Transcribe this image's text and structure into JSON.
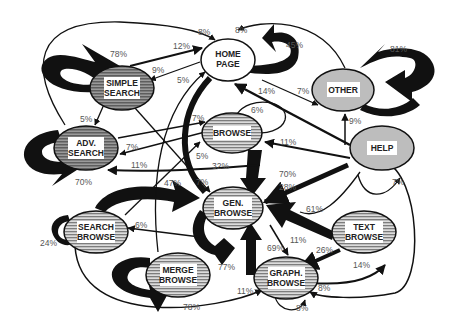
{
  "diagram": {
    "type": "state-transition-graph",
    "nodes": [
      {
        "id": "simple_search",
        "label_lines": [
          "SIMPLE",
          "SEARCH"
        ],
        "style": "dark-striped",
        "self_loop": "78%"
      },
      {
        "id": "home_page",
        "label_lines": [
          "HOME",
          "PAGE"
        ],
        "style": "white",
        "self_loop": "45%"
      },
      {
        "id": "other",
        "label_lines": [
          "OTHER"
        ],
        "style": "light-gray",
        "self_loop": "81%"
      },
      {
        "id": "adv_search",
        "label_lines": [
          "ADV.",
          "SEARCH"
        ],
        "style": "dark-striped",
        "self_loop": "70%"
      },
      {
        "id": "browse",
        "label_lines": [
          "BROWSE"
        ],
        "style": "striped",
        "self_loop": "6%"
      },
      {
        "id": "help",
        "label_lines": [
          "HELP"
        ],
        "style": "light-gray",
        "self_loop": "7%"
      },
      {
        "id": "gen_browse",
        "label_lines": [
          "GEN.",
          "BROWSE"
        ],
        "style": "striped",
        "self_loop": "77%"
      },
      {
        "id": "search_browse",
        "label_lines": [
          "SEARCH",
          "BROWSE"
        ],
        "style": "striped",
        "self_loop": "24%"
      },
      {
        "id": "text_browse",
        "label_lines": [
          "TEXT",
          "BROWSE"
        ],
        "style": "striped",
        "self_loop": null
      },
      {
        "id": "merge_browse",
        "label_lines": [
          "MERGE",
          "BROWSE"
        ],
        "style": "striped",
        "self_loop": "78%"
      },
      {
        "id": "graph_browse",
        "label_lines": [
          "GRAPH.",
          "BROWSE"
        ],
        "style": "striped",
        "self_loop": "8%"
      }
    ],
    "edge_labels": [
      {
        "text": "8%",
        "from": "adv_search",
        "to": "home_page"
      },
      {
        "text": "12%",
        "from": "simple_search",
        "to": "home_page"
      },
      {
        "text": "9%",
        "from": "home_page",
        "to": "simple_search"
      },
      {
        "text": "5%",
        "from": "merge_browse",
        "to": "home_page"
      },
      {
        "text": "78%",
        "note": "simple_search self loop"
      },
      {
        "text": "8%",
        "from": "other",
        "to": "home_page"
      },
      {
        "text": "45%",
        "note": "home_page self loop"
      },
      {
        "text": "14%",
        "from": "help",
        "to": "home_page"
      },
      {
        "text": "7%",
        "from": "home_page",
        "to": "other"
      },
      {
        "text": "81%",
        "note": "other self loop"
      },
      {
        "text": "9%",
        "from": "help",
        "to": "other"
      },
      {
        "text": "5%",
        "from": "simple_search",
        "to": "adv_search"
      },
      {
        "text": "7%",
        "from": "adv_search",
        "to": "browse"
      },
      {
        "text": "7%",
        "from": "browse",
        "to": "adv_search"
      },
      {
        "text": "6%",
        "note": "browse self loop"
      },
      {
        "text": "11%",
        "from": "help",
        "to": "browse"
      },
      {
        "text": "5%",
        "from": "search_browse",
        "to": "browse"
      },
      {
        "text": "11%",
        "from": "gen_browse",
        "to": "adv_search"
      },
      {
        "text": "32%",
        "from": "home_page",
        "to": "gen_browse"
      },
      {
        "text": "70%",
        "note": "adv_search self loop"
      },
      {
        "text": "70%",
        "from": "browse",
        "to": "gen_browse"
      },
      {
        "text": "28%",
        "from": "help",
        "to": "gen_browse"
      },
      {
        "text": "47%",
        "from": "search_browse",
        "to": "gen_browse"
      },
      {
        "text": "7%",
        "from": "simple_search",
        "to": "gen_browse"
      },
      {
        "text": "6%",
        "from": "gen_browse",
        "to": "search_browse"
      },
      {
        "text": "24%",
        "note": "search_browse self loop"
      },
      {
        "text": "61%",
        "from": "text_browse",
        "to": "gen_browse"
      },
      {
        "text": "7%",
        "note": "help self loop"
      },
      {
        "text": "11%",
        "from": "gen_browse",
        "to": "graph_browse"
      },
      {
        "text": "69%",
        "from": "graph_browse",
        "to": "gen_browse"
      },
      {
        "text": "26%",
        "from": "text_browse",
        "to": "graph_browse"
      },
      {
        "text": "14%",
        "from": "graph_browse",
        "to": "text_browse"
      },
      {
        "text": "77%",
        "note": "gen_browse self loop"
      },
      {
        "text": "11%",
        "from": "search_browse",
        "to": "graph_browse"
      },
      {
        "text": "78%",
        "note": "merge_browse self loop"
      },
      {
        "text": "8%",
        "from": "help",
        "to": "graph_browse"
      },
      {
        "text": "8%",
        "note": "graph_browse self loop"
      }
    ]
  },
  "labels": {
    "simple_search": [
      "SIMPLE",
      "SEARCH"
    ],
    "home_page": [
      "HOME",
      "PAGE"
    ],
    "other": [
      "OTHER"
    ],
    "adv_search": [
      "ADV.",
      "SEARCH"
    ],
    "browse": [
      "BROWSE"
    ],
    "help": [
      "HELP"
    ],
    "gen_browse": [
      "GEN.",
      "BROWSE"
    ],
    "search_browse": [
      "SEARCH",
      "BROWSE"
    ],
    "text_browse": [
      "TEXT",
      "BROWSE"
    ],
    "merge_browse": [
      "MERGE",
      "BROWSE"
    ],
    "graph_browse": [
      "GRAPH.",
      "BROWSE"
    ]
  },
  "pct": {
    "p_8_top": "8%",
    "p_12": "12%",
    "p_9": "9%",
    "p_5_home": "5%",
    "p_78_simple": "78%",
    "p_8_other": "8%",
    "p_45": "45%",
    "p_14_help": "14%",
    "p_7_other": "7%",
    "p_81": "81%",
    "p_9_other": "9%",
    "p_5_adv": "5%",
    "p_7_browse_in": "7%",
    "p_7_adv_in": "7%",
    "p_6_browse": "6%",
    "p_11_browse": "11%",
    "p_5_browse": "5%",
    "p_11_adv": "11%",
    "p_32": "32%",
    "p_70_adv": "70%",
    "p_70_gen": "70%",
    "p_28": "28%",
    "p_47": "47%",
    "p_7_gen": "7%",
    "p_6_search": "6%",
    "p_24": "24%",
    "p_61": "61%",
    "p_7_help": "7%",
    "p_11_graph": "11%",
    "p_69": "69%",
    "p_26": "26%",
    "p_14_text": "14%",
    "p_77": "77%",
    "p_11_graph_in": "11%",
    "p_78_merge": "78%",
    "p_8_graph_right": "8%",
    "p_8_graph_self": "8%"
  },
  "colors": {
    "stroke": "#111111",
    "label_text": "#555555",
    "light_fill": "#bdbdbd",
    "dark_fill": "#7a7a7a",
    "stripe_light": "#d8d8d8",
    "stripe_dark": "#888888"
  }
}
